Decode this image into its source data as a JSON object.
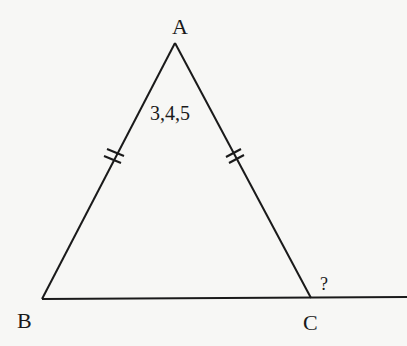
{
  "diagram": {
    "type": "geometry-figure",
    "shape": "isosceles-triangle",
    "vertices": {
      "A": {
        "label": "A",
        "x": 175,
        "y": 43
      },
      "B": {
        "label": "B",
        "x": 42,
        "y": 299
      },
      "C": {
        "label": "C",
        "x": 311,
        "y": 298
      }
    },
    "apex_angle_label": "3,4,5",
    "exterior_angle_label": "?",
    "equal_sides": [
      "AB",
      "AC"
    ],
    "tick_marks_per_side": 2,
    "colors": {
      "line": "#1a1a1a",
      "background": "#f7f7f5"
    }
  }
}
